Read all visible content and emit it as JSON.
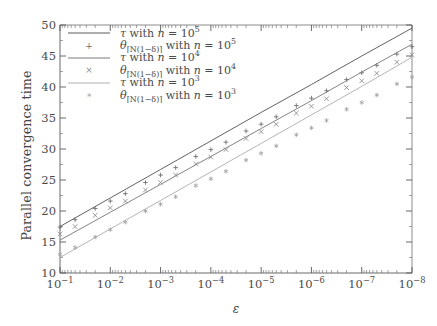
{
  "chart_data": {
    "type": "line",
    "title": "",
    "xlabel": "ε",
    "ylabel": "Parallel convergence time",
    "xscale": "log",
    "xlim": [
      0.1,
      1e-08
    ],
    "ylim": [
      10,
      50
    ],
    "grid": false,
    "legend_position": "upper-left",
    "xtick_labels": [
      "10⁻¹",
      "10⁻²",
      "10⁻³",
      "10⁻⁴",
      "10⁻⁵",
      "10⁻⁶",
      "10⁻⁷",
      "10⁻⁸"
    ],
    "xtick_mantissa": [
      "10",
      "10",
      "10",
      "10",
      "10",
      "10",
      "10",
      "10"
    ],
    "xtick_exponent": [
      "-1",
      "-2",
      "-3",
      "-4",
      "-5",
      "-6",
      "-7",
      "-8"
    ],
    "ytick_labels": [
      "10",
      "15",
      "20",
      "25",
      "30",
      "35",
      "40",
      "45",
      "50"
    ],
    "ytick_values": [
      10,
      15,
      20,
      25,
      30,
      35,
      40,
      45,
      50
    ],
    "x": [
      -1,
      -2,
      -3,
      -4,
      -5,
      -6,
      -7,
      -8
    ],
    "series": [
      {
        "name": "tau_n5",
        "label_prefix": "τ",
        "label_middle": "with",
        "label_var": "n",
        "label_eq": "=",
        "label_base": "10",
        "label_exp": "5",
        "kind": "line",
        "color": "#5a5a5a",
        "marker": "none",
        "x": [
          -1,
          -2,
          -3,
          -4,
          -5,
          -6,
          -7,
          -8
        ],
        "values": [
          17.5,
          22.1,
          26.7,
          31.3,
          35.9,
          40.4,
          45.0,
          49.5
        ]
      },
      {
        "name": "theta_n5",
        "label_prefix": "θ",
        "label_sub": "⌈N(1−δ)⌉",
        "label_middle": "with",
        "label_var": "n",
        "label_eq": "=",
        "label_base": "10",
        "label_exp": "5",
        "kind": "markers",
        "color": "#6b6b6b",
        "marker": "+",
        "x": [
          -1.0,
          -1.3,
          -1.7,
          -2.0,
          -2.3,
          -2.7,
          -3.0,
          -3.3,
          -3.7,
          -4.0,
          -4.3,
          -4.7,
          -5.0,
          -5.3,
          -5.7,
          -6.0,
          -6.3,
          -6.7,
          -7.0,
          -7.3,
          -7.7,
          -8.0
        ],
        "values": [
          17.4,
          18.6,
          20.4,
          21.6,
          22.8,
          24.6,
          25.8,
          27.0,
          28.8,
          29.9,
          31.1,
          32.9,
          34.0,
          35.2,
          37.0,
          38.2,
          39.4,
          41.2,
          42.3,
          43.5,
          45.3,
          46.5
        ]
      },
      {
        "name": "tau_n4",
        "label_prefix": "τ",
        "label_middle": "with",
        "label_var": "n",
        "label_eq": "=",
        "label_base": "10",
        "label_exp": "4",
        "kind": "line",
        "color": "#7d7d7d",
        "marker": "none",
        "x": [
          -1,
          -2,
          -3,
          -4,
          -5,
          -6,
          -7,
          -8
        ],
        "values": [
          15.3,
          19.8,
          24.3,
          28.8,
          33.3,
          37.8,
          42.4,
          46.9
        ]
      },
      {
        "name": "theta_n4",
        "label_prefix": "θ",
        "label_sub": "⌈N(1−δ)⌉",
        "label_middle": "with",
        "label_var": "n",
        "label_eq": "=",
        "label_base": "10",
        "label_exp": "4",
        "kind": "markers",
        "color": "#8a8a8a",
        "marker": "×",
        "x": [
          -1.0,
          -1.3,
          -1.7,
          -2.0,
          -2.3,
          -2.7,
          -3.0,
          -3.3,
          -3.7,
          -4.0,
          -4.3,
          -4.7,
          -5.0,
          -5.3,
          -5.7,
          -6.0,
          -6.3,
          -6.7,
          -7.0,
          -7.3,
          -7.7,
          -8.0
        ],
        "values": [
          16.3,
          17.5,
          19.3,
          20.5,
          21.6,
          23.4,
          24.6,
          25.8,
          27.6,
          28.7,
          29.9,
          31.7,
          32.8,
          34.0,
          35.8,
          36.9,
          38.1,
          39.9,
          41.0,
          42.2,
          44.0,
          45.2
        ]
      },
      {
        "name": "tau_n3",
        "label_prefix": "τ",
        "label_middle": "with",
        "label_var": "n",
        "label_eq": "=",
        "label_base": "10",
        "label_exp": "3",
        "kind": "line",
        "color": "#b0b0b0",
        "marker": "none",
        "x": [
          -1,
          -2,
          -3,
          -4,
          -5,
          -6,
          -7,
          -8
        ],
        "values": [
          12.5,
          17.1,
          21.7,
          26.3,
          30.9,
          35.5,
          40.1,
          44.8
        ]
      },
      {
        "name": "theta_n3",
        "label_prefix": "θ",
        "label_sub": "⌈N(1−δ)⌉",
        "label_middle": "with",
        "label_var": "n",
        "label_eq": "=",
        "label_base": "10",
        "label_exp": "3",
        "kind": "markers",
        "color": "#a3a3a3",
        "marker": "∗",
        "x": [
          -1.0,
          -1.3,
          -1.7,
          -2.0,
          -2.3,
          -2.7,
          -3.0,
          -3.3,
          -3.7,
          -4.0,
          -4.3,
          -4.7,
          -5.0,
          -5.3,
          -5.7,
          -6.0,
          -6.3,
          -6.7,
          -7.0,
          -7.3,
          -7.7,
          -8.0
        ],
        "values": [
          13.0,
          14.1,
          15.8,
          17.0,
          18.2,
          20.0,
          21.1,
          22.3,
          24.1,
          25.2,
          26.4,
          28.2,
          29.3,
          30.5,
          32.3,
          33.4,
          34.6,
          36.4,
          37.5,
          38.7,
          40.5,
          41.6
        ]
      }
    ],
    "legend_entries": [
      {
        "marker": "line",
        "color": "#5a5a5a",
        "text": "τ with n = 10^5"
      },
      {
        "marker": "+",
        "color": "#6b6b6b",
        "text": "θ⌈N(1−δ)⌉ with n = 10^5"
      },
      {
        "marker": "line",
        "color": "#7d7d7d",
        "text": "τ with n = 10^4"
      },
      {
        "marker": "×",
        "color": "#8a8a8a",
        "text": "θ⌈N(1−δ)⌉ with n = 10^4"
      },
      {
        "marker": "line",
        "color": "#b0b0b0",
        "text": "τ with n = 10^3"
      },
      {
        "marker": "∗",
        "color": "#a3a3a3",
        "text": "θ⌈N(1−δ)⌉ with n = 10^3"
      }
    ]
  },
  "axes": {
    "ylabel": "Parallel convergence time",
    "xlabel": "ε"
  },
  "legend": {
    "rows": [
      {
        "symbol": "—",
        "tau": "τ",
        "with": "with",
        "n": "n",
        "eq": "=",
        "base": "10",
        "exp": "5",
        "theta": "",
        "sub": ""
      },
      {
        "symbol": "+",
        "tau": "",
        "with": "with",
        "n": "n",
        "eq": "=",
        "base": "10",
        "exp": "5",
        "theta": "θ",
        "sub": "⌈N(1−δ)⌉"
      },
      {
        "symbol": "—",
        "tau": "τ",
        "with": "with",
        "n": "n",
        "eq": "=",
        "base": "10",
        "exp": "4",
        "theta": "",
        "sub": ""
      },
      {
        "symbol": "×",
        "tau": "",
        "with": "with",
        "n": "n",
        "eq": "=",
        "base": "10",
        "exp": "4",
        "theta": "θ",
        "sub": "⌈N(1−δ)⌉"
      },
      {
        "symbol": "—",
        "tau": "τ",
        "with": "with",
        "n": "n",
        "eq": "=",
        "base": "10",
        "exp": "3",
        "theta": "",
        "sub": ""
      },
      {
        "symbol": "∗",
        "tau": "",
        "with": "with",
        "n": "n",
        "eq": "=",
        "base": "10",
        "exp": "3",
        "theta": "θ",
        "sub": "⌈N(1−δ)⌉"
      }
    ]
  }
}
